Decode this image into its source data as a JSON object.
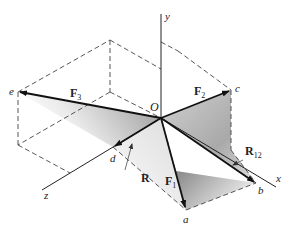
{
  "diagram": {
    "type": "3d-force-vector-diagram",
    "origin_label": "O",
    "axes": [
      {
        "name": "x",
        "label": "x"
      },
      {
        "name": "y",
        "label": "y"
      },
      {
        "name": "z",
        "label": "z"
      }
    ],
    "points": {
      "a": "a",
      "b": "b",
      "c": "c",
      "d": "d",
      "e": "e"
    },
    "vectors": [
      {
        "label": "F",
        "sub": "1",
        "from": "O",
        "to": "a"
      },
      {
        "label": "F",
        "sub": "2",
        "from": "O",
        "to": "c"
      },
      {
        "label": "F",
        "sub": "3",
        "from": "O",
        "to": "e"
      },
      {
        "label": "R",
        "sub": "12",
        "from": "O",
        "to": "b"
      },
      {
        "label": "R",
        "sub": "",
        "from": "O",
        "to": "d"
      }
    ],
    "colors": {
      "line": "#222222",
      "dash": "#444444",
      "shade_dark": "#8a8a8a",
      "shade_light": "#ffffff"
    }
  }
}
